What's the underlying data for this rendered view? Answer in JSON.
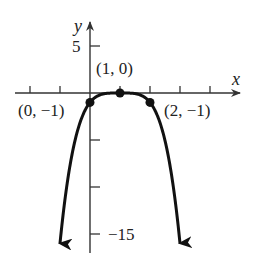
{
  "chart_data": {
    "type": "line",
    "title": "",
    "function": "y = -(x - 1)^4",
    "xlabel": "x",
    "ylabel": "y",
    "xlim": [
      -2,
      5
    ],
    "ylim": [
      -15,
      5
    ],
    "x_ticks": [
      -2,
      -1,
      0,
      1,
      2,
      3,
      4
    ],
    "y_ticks": [
      5,
      0,
      -5,
      -10,
      -15
    ],
    "y_tick_labels": [
      {
        "value": 5,
        "label": "5"
      },
      {
        "value": -15,
        "label": "−15"
      }
    ],
    "grid": false,
    "legend": null,
    "curve_points": [
      {
        "x": -1.0,
        "y": -16
      },
      {
        "x": -0.5,
        "y": -5.0625
      },
      {
        "x": 0.0,
        "y": -1
      },
      {
        "x": 0.5,
        "y": -0.0625
      },
      {
        "x": 1.0,
        "y": 0
      },
      {
        "x": 1.5,
        "y": -0.0625
      },
      {
        "x": 2.0,
        "y": -1
      },
      {
        "x": 2.5,
        "y": -5.0625
      },
      {
        "x": 3.0,
        "y": -16
      }
    ],
    "labeled_points": [
      {
        "x": 0,
        "y": -1,
        "label": "(0, −1)"
      },
      {
        "x": 1,
        "y": 0,
        "label": "(1, 0)"
      },
      {
        "x": 2,
        "y": -1,
        "label": "(2, −1)"
      }
    ],
    "arrows_at_ends": true,
    "colors": {
      "axis": "#333333",
      "curve": "#111111",
      "text": "#222222"
    }
  }
}
